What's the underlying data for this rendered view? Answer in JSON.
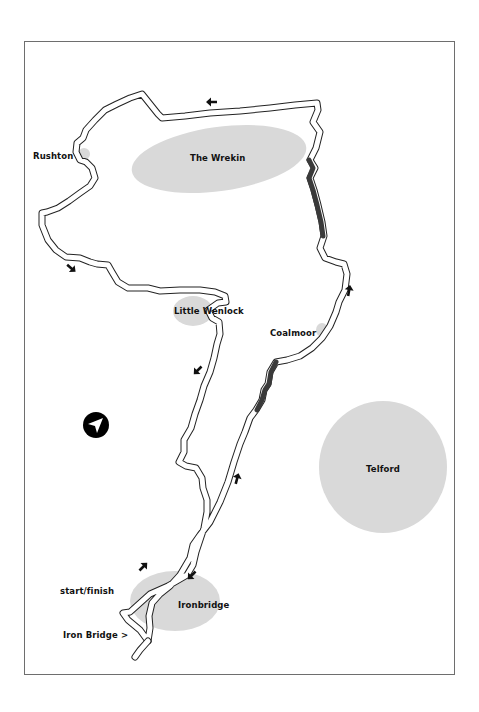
{
  "map": {
    "colors": {
      "background": "#ffffff",
      "frame": "#6e6e6e",
      "area_fill": "#d9d9d9",
      "route_outline": "#222222",
      "route_fill": "#ffffff",
      "climb_section": "#3a3a3a",
      "arrow": "#111111"
    },
    "areas": [
      {
        "name": "The Wrekin",
        "shape": "ellipse",
        "cx": 219,
        "cy": 159,
        "rx": 88,
        "ry": 32,
        "rotate": -8
      },
      {
        "name": "Little Wenlock",
        "shape": "ellipse",
        "cx": 193,
        "cy": 311,
        "rx": 20,
        "ry": 15,
        "rotate": 0
      },
      {
        "name": "Telford",
        "shape": "ellipse",
        "cx": 383,
        "cy": 467,
        "rx": 64,
        "ry": 66,
        "rotate": 0
      },
      {
        "name": "Ironbridge",
        "shape": "ellipse",
        "cx": 175,
        "cy": 601,
        "rx": 45,
        "ry": 30,
        "rotate": 0
      },
      {
        "name": "Rushton",
        "shape": "ellipse",
        "cx": 84,
        "cy": 154,
        "rx": 6,
        "ry": 6,
        "rotate": 0
      },
      {
        "name": "Coalmoor",
        "shape": "ellipse",
        "cx": 322,
        "cy": 330,
        "rx": 6,
        "ry": 7,
        "rotate": 0
      }
    ],
    "labels": [
      {
        "text": "The Wrekin",
        "x": 190,
        "y": 159
      },
      {
        "text": "Rushton",
        "x": 33,
        "y": 157
      },
      {
        "text": "Little Wenlock",
        "x": 174,
        "y": 312
      },
      {
        "text": "Coalmoor",
        "x": 270,
        "y": 334
      },
      {
        "text": "Telford",
        "x": 366,
        "y": 470
      },
      {
        "text": "start/finish",
        "x": 60,
        "y": 592
      },
      {
        "text": "Ironbridge",
        "x": 178,
        "y": 606
      },
      {
        "text": "Iron Bridge >",
        "x": 63,
        "y": 636
      }
    ],
    "compass": {
      "icon": "compass-arrow-icon",
      "cx": 96,
      "cy": 425,
      "r": 13
    },
    "direction_arrows": [
      {
        "x": 212,
        "y": 102,
        "angle": 180
      },
      {
        "x": 71,
        "y": 268,
        "angle": 40
      },
      {
        "x": 198,
        "y": 370,
        "angle": 135
      },
      {
        "x": 349,
        "y": 291,
        "angle": -80
      },
      {
        "x": 237,
        "y": 479,
        "angle": -75
      },
      {
        "x": 143,
        "y": 567,
        "angle": -45
      },
      {
        "x": 192,
        "y": 575,
        "angle": 135
      }
    ],
    "route": {
      "main_loop": "M 148,641 L 140,630 L 128,620 L 123,613 L 130,612 L 140,603 L 150,594 L 168,586 L 187,575 L 193,565 L 196,552 L 200,540 L 204,528 L 207,512 L 207,500 L 203,488 L 202,478 L 196,468 L 186,466 L 179,462 L 184,452 L 184,440 L 191,428 L 195,414 L 200,400 L 204,386 L 210,372 L 214,358 L 217,344 L 220,334 L 219,322 L 212,318 L 208,310 L 218,303 L 226,302 L 225,296 L 215,292 L 200,290 L 180,290 L 160,291 L 148,288 L 128,288 L 118,282 L 112,272 L 108,265 L 97,264 L 90,262 L 80,258 L 66,257 L 56,250 L 48,240 L 42,225 L 42,213 L 47,212 L 58,208 L 69,201 L 80,193 L 90,186 L 95,178 L 92,168 L 86,162 L 80,160 L 76,152 L 77,143 L 83,138 L 86,130 L 95,120 L 105,110 L 117,104 L 130,98 L 142,94 L 158,114 L 162,118 L 185,116 L 210,113 L 240,111 L 270,108 L 295,105 L 317,103 L 318,110 L 313,122 L 320,132 L 316,148 L 310,160 L 315,168 L 310,178 L 314,190 L 318,205 L 322,222 L 324,236 L 320,248 L 325,258 L 336,262 L 344,264 L 347,274 L 345,290 L 339,302 L 336,312 L 330,326 L 322,338 L 312,348 L 300,356 L 287,360 L 276,362 L 270,372 L 268,384 L 264,390 L 262,400 L 256,410 L 250,418 L 245,432 L 240,444 L 234,462 L 228,482 L 220,502 L 210,522 L 200,535 L 193,545 L 190,558 L 180,575 L 170,586 L 160,594 L 152,603 L 149,616 L 150,628 L 148,641",
      "spur": "M 148,641 L 140,650 L 135,657",
      "climb_sections": [
        "M 309,160 L 313,168 L 309,178 L 313,190 L 317,205 L 321,222 L 323,236",
        "M 276,362 L 271,372 L 269,384 L 265,390 L 262,400 L 257,410"
      ]
    }
  }
}
